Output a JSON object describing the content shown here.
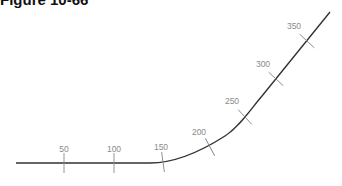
{
  "figure": {
    "title": "Figure 10-66",
    "stations": [
      {
        "label": "50",
        "x": 64,
        "y": 163,
        "angle": 0,
        "lx": 64,
        "ly": 152
      },
      {
        "label": "100",
        "x": 114,
        "y": 163,
        "angle": 0,
        "lx": 114,
        "ly": 152
      },
      {
        "label": "150",
        "x": 163,
        "y": 162,
        "angle": -8,
        "lx": 161,
        "ly": 150
      },
      {
        "label": "200",
        "x": 210,
        "y": 147,
        "angle": -28,
        "lx": 199,
        "ly": 135
      },
      {
        "label": "250",
        "x": 245,
        "y": 117,
        "angle": -43,
        "lx": 232,
        "ly": 104
      },
      {
        "label": "300",
        "x": 276,
        "y": 79,
        "angle": -47,
        "lx": 263,
        "ly": 67
      },
      {
        "label": "350",
        "x": 307,
        "y": 41,
        "angle": -47,
        "lx": 294,
        "ly": 29
      }
    ],
    "line_color": "#333333",
    "tick_color": "#8a8a8a"
  }
}
